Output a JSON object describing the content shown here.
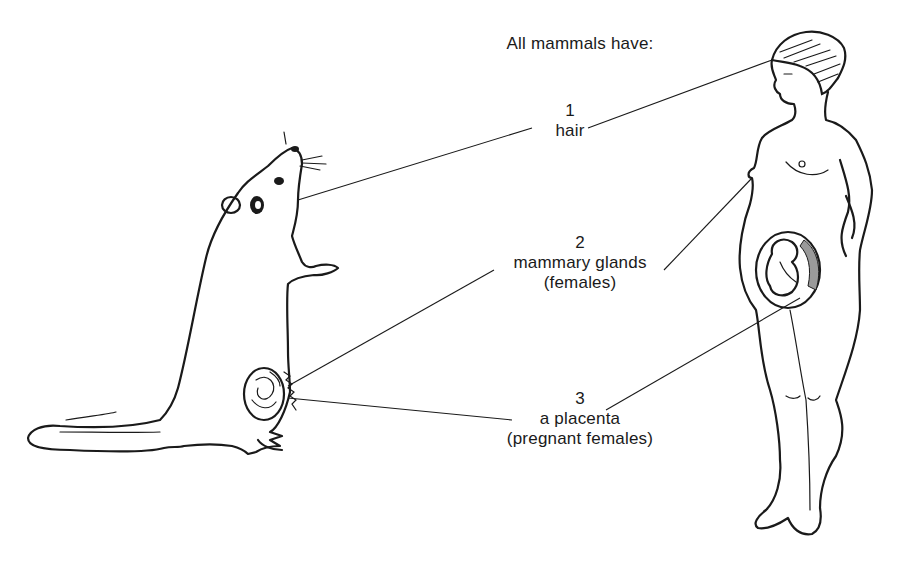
{
  "figure": {
    "title": "All mammals have:",
    "features": [
      {
        "number": "1",
        "label": "hair",
        "note": ""
      },
      {
        "number": "2",
        "label": "mammary glands",
        "note": "(females)"
      },
      {
        "number": "3",
        "label": "a placenta",
        "note": "(pregnant females)"
      }
    ],
    "subjects": [
      "rat-illustration",
      "pregnant-woman-illustration"
    ],
    "colors": {
      "ink": "#1a1a1a",
      "background": "#ffffff"
    }
  }
}
